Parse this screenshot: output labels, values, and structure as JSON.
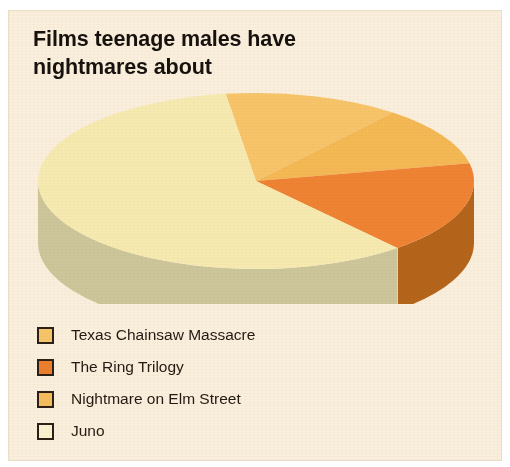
{
  "figure": {
    "background_color": "#faeedc",
    "border_color": "#e8ddc6"
  },
  "title": {
    "line1": "Films teenage males have",
    "line2": "nightmares about",
    "color": "#17120e"
  },
  "chart_data": {
    "type": "pie",
    "title": "Films teenage males have nightmares about",
    "subtitle": "",
    "xlabel": "",
    "ylabel": "",
    "style": "3d-exploded-none",
    "legend_position": "bottom-left",
    "grid": false,
    "start_angle_deg": -98,
    "direction": "clockwise",
    "categories": [
      "Texas Chainsaw Massacre",
      "The Ring Trilogy",
      "Nightmare on Elm Street",
      "Juno"
    ],
    "values": [
      13,
      17,
      11,
      59
    ],
    "slices": [
      {
        "label": "Texas Chainsaw Massacre",
        "value": 13,
        "order": 1,
        "top_color": "#f7c46a",
        "side_color": "#c08b34",
        "swatch_color": "#f6c469"
      },
      {
        "label": "The Ring Trilogy",
        "value": 17,
        "order": 3,
        "top_color": "#ef8334",
        "side_color": "#b5651b",
        "swatch_color": "#ec7f2e"
      },
      {
        "label": "Nightmare on Elm Street",
        "value": 11,
        "order": 2,
        "top_color": "#f4b855",
        "side_color": "#bd8229",
        "swatch_color": "#f5bc5d"
      },
      {
        "label": "Juno",
        "value": 59,
        "order": 4,
        "top_color": "#f6eab0",
        "side_color": "#ccc69a",
        "swatch_color": "#f9f1cf"
      }
    ]
  },
  "legend": {
    "items": [
      {
        "label": "Texas Chainsaw Massacre",
        "color": "#f6c469"
      },
      {
        "label": "The Ring Trilogy",
        "color": "#ec7f2e"
      },
      {
        "label": "Nightmare on Elm Street",
        "color": "#f5bc5d"
      },
      {
        "label": "Juno",
        "color": "#f9f1cf"
      }
    ],
    "swatch_border_color": "#2a2018",
    "text_color": "#231a12"
  }
}
